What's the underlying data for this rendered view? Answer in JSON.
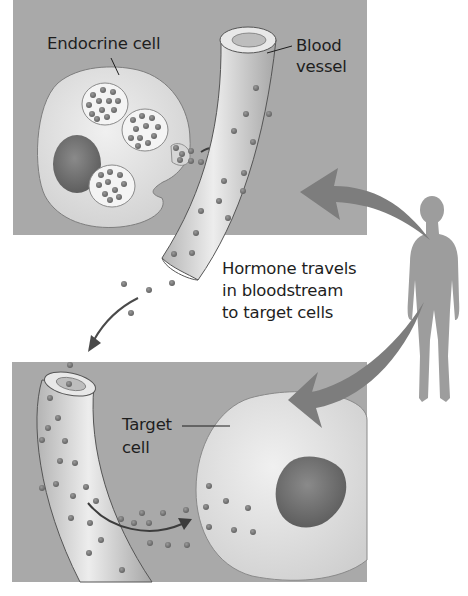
{
  "figure": {
    "colors": {
      "panel_bg": "#a9a9a9",
      "cell_fill": "#e2e2e2",
      "nucleus": "#6e6e6e",
      "hormone_dot": "#7a7a7a",
      "big_arrow": "#7d7d7d",
      "human_silhouette": "#9d9d9d",
      "text": "#1e1e1e"
    },
    "panels": [
      {
        "id": "top",
        "label_items": [
          "Endocrine cell",
          "Blood vessel"
        ]
      },
      {
        "id": "bottom",
        "label_items": [
          "Target cell"
        ]
      }
    ]
  },
  "labels": {
    "endocrine_cell": "Endocrine cell",
    "blood_vessel_line1": "Blood",
    "blood_vessel_line2": "vessel",
    "hormone_line1": "Hormone travels",
    "hormone_line2": "in bloodstream",
    "hormone_line3": "to target cells",
    "target_cell_line1": "Target",
    "target_cell_line2": "cell"
  }
}
